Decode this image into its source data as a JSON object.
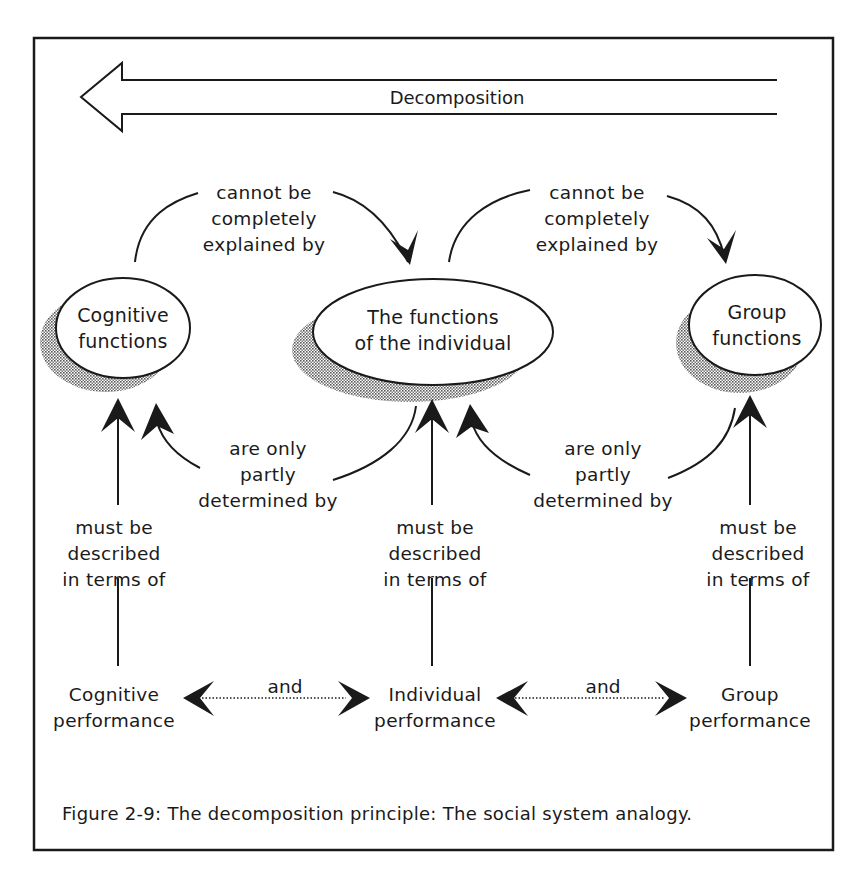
{
  "figure": {
    "caption": "Figure 2-9: The decomposition principle: The social system analogy.",
    "colors": {
      "ink": "#1a1a1a",
      "background": "#ffffff",
      "shadow": "#9a9a9a"
    }
  },
  "decomposition_arrow": {
    "label": "Decomposition",
    "direction": "left"
  },
  "nodes": {
    "cognitive_functions": {
      "line1": "Cognitive",
      "line2": "functions"
    },
    "individual_functions": {
      "line1": "The functions",
      "line2": "of the individual"
    },
    "group_functions": {
      "line1": "Group",
      "line2": "functions"
    }
  },
  "relations": {
    "cannot_explain": {
      "line1": "cannot be",
      "line2": "completely",
      "line3": "explained by"
    },
    "partly_determined": {
      "line1": "are only",
      "line2": "partly",
      "line3": "determined by"
    },
    "described_in_terms": {
      "line1": "must be",
      "line2": "described",
      "line3": "in terms of"
    },
    "and": "and"
  },
  "performance": {
    "cognitive": {
      "line1": "Cognitive",
      "line2": "performance"
    },
    "individual": {
      "line1": "Individual",
      "line2": "performance"
    },
    "group": {
      "line1": "Group",
      "line2": "performance"
    }
  }
}
